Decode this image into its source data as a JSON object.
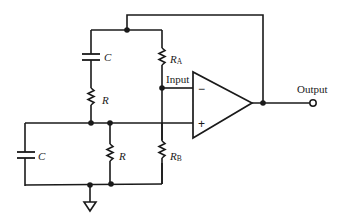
{
  "diagram": {
    "type": "circuit-schematic",
    "components": {
      "cap_series": {
        "label": "C"
      },
      "res_series": {
        "label": "R"
      },
      "cap_shunt": {
        "label": "C"
      },
      "res_shunt": {
        "label": "R"
      },
      "res_a": {
        "label": "R",
        "subscript": "A"
      },
      "res_b": {
        "label": "R",
        "subscript": "B"
      }
    },
    "labels": {
      "input": "Input",
      "output": "Output",
      "inverting": "−",
      "non_inverting": "+"
    },
    "colors": {
      "line": "#1a1a1a",
      "background": "#ffffff"
    }
  }
}
